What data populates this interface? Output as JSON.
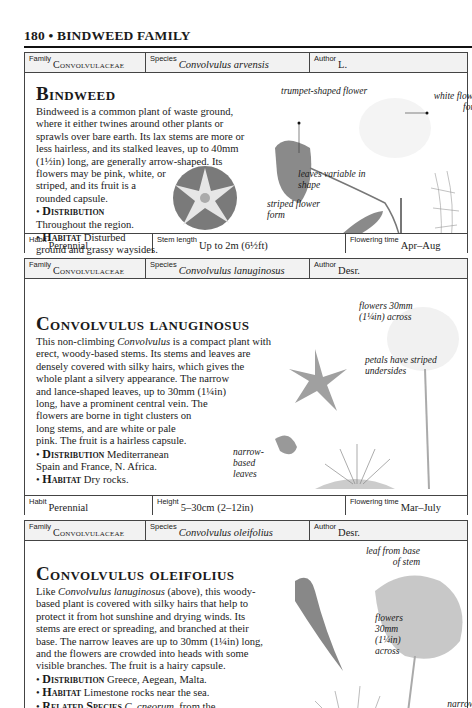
{
  "page_header": {
    "text": "180 • BINDWEED FAMILY"
  },
  "entries": [
    {
      "family_label": "Family",
      "family": "Convolvulaceae",
      "species_label": "Species",
      "species": "Convolvulus arvensis",
      "author_label": "Author",
      "author": "L.",
      "title": "Bindweed",
      "description_lines": [
        "Bindweed is a common plant of waste ground,",
        "where it either twines around other plants or",
        "sprawls over bare earth. Its lax stems are more or",
        "less hairless, and its stalked leaves, up to 40mm",
        "(1½in) long, are generally arrow-shaped. Its",
        "flowers may be pink, white, or",
        "striped, and its fruit is a",
        "rounded capsule."
      ],
      "bullets": [
        {
          "label": "Distribution",
          "text": "Throughout the region."
        },
        {
          "label": "Habitat",
          "text": "Disturbed ground and grassy waysides."
        }
      ],
      "annotations": [
        "trumpet-shaped flower",
        "white flower form",
        "leaves variable in shape",
        "striped flower form"
      ],
      "habit_label": "Habit",
      "habit": "Perennial",
      "measure_label": "Stem length",
      "measure": "Up to 2m (6½ft)",
      "flowering_label": "Flowering time",
      "flowering": "Apr–Aug"
    },
    {
      "family_label": "Family",
      "family": "Convolvulaceae",
      "species_label": "Species",
      "species": "Convolvulus lanuginosus",
      "author_label": "Author",
      "author": "Desr.",
      "title": "Convolvulus lanuginosus",
      "description_lines": [
        "This non-climbing Convolvulus is a compact plant with",
        "erect, woody-based stems. Its stems and leaves are",
        "densely covered with silky hairs, which gives the",
        "whole plant a silvery appearance. The narrow",
        "and lance-shaped leaves, up to 30mm (1¼in)",
        "long, have a prominent central vein. The",
        "flowers are borne in tight clusters on",
        "long stems, and are white or pale",
        "pink. The fruit is a hairless capsule."
      ],
      "bullets": [
        {
          "label": "Distribution",
          "text": "Mediterranean Spain and France, N. Africa."
        },
        {
          "label": "Habitat",
          "text": "Dry rocks."
        }
      ],
      "annotations": [
        "flowers 30mm (1¼in) across",
        "petals have striped undersides",
        "narrow-based leaves"
      ],
      "habit_label": "Habit",
      "habit": "Perennial",
      "measure_label": "Height",
      "measure": "5–30cm (2–12in)",
      "flowering_label": "Flowering time",
      "flowering": "Mar–July"
    },
    {
      "family_label": "Family",
      "family": "Convolvulaceae",
      "species_label": "Species",
      "species": "Convolvulus oleifolius",
      "author_label": "Author",
      "author": "Desr.",
      "title": "Convolvulus oleifolius",
      "description_lines": [
        "Like Convolvulus lanuginosus (above), this woody-",
        "based plant is covered with silky hairs that help to",
        "protect it from hot sunshine and drying winds. Its",
        "stems are erect or spreading, and branched at their",
        "base. The narrow leaves are up to 30mm (1¼in) long,",
        "and the flowers are crowded into heads with some",
        "visible branches. The fruit is a hairy capsule."
      ],
      "bullets": [
        {
          "label": "Distribution",
          "text": "Greece, Aegean, Malta."
        },
        {
          "label": "Habitat",
          "text": "Limestone rocks near the sea."
        },
        {
          "label": "Related Species",
          "text": "C. cneorum, from the W. Mediterranean, is a more robust plant with"
        }
      ],
      "annotations": [
        "leaf from base of stem",
        "flowers 30mm (1¼in) across",
        "narrow leaves"
      ]
    }
  ]
}
